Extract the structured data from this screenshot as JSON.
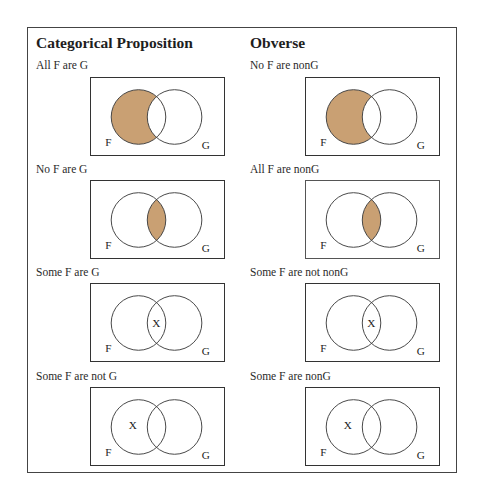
{
  "columns": {
    "left_header": "Categorical Proposition",
    "right_header": "Obverse"
  },
  "colors": {
    "shade": "#c9a073",
    "outline": "#444444",
    "background": "#ffffff"
  },
  "rows": [
    {
      "proposition": "All F are G",
      "obverse": "No F are nonG",
      "diagram": "F-only region shaded",
      "left_set_label": "F",
      "right_set_label": "G"
    },
    {
      "proposition": "No F are G",
      "obverse": "All F are nonG",
      "diagram": "intersection shaded",
      "left_set_label": "F",
      "right_set_label": "G"
    },
    {
      "proposition": "Some F are G",
      "obverse": "Some F are not nonG",
      "diagram": "X in intersection",
      "left_set_label": "F",
      "right_set_label": "G",
      "mark": "X"
    },
    {
      "proposition": "Some F are not G",
      "obverse": "Some F are nonG",
      "diagram": "X in F-only region",
      "left_set_label": "F",
      "right_set_label": "G",
      "mark": "X"
    }
  ]
}
